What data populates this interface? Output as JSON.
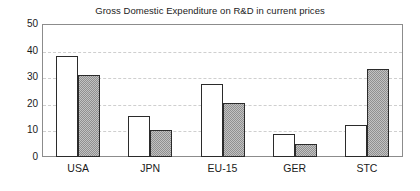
{
  "chart_data": {
    "type": "bar",
    "title": "Gross Domestic Expenditure on R&D in current prices",
    "xlabel": "",
    "ylabel": "",
    "categories": [
      "USA",
      "JPN",
      "EU-15",
      "GER",
      "STC"
    ],
    "series": [
      {
        "name": "series-a",
        "style": "white",
        "values": [
          38,
          15.5,
          27.5,
          8.5,
          12
        ]
      },
      {
        "name": "series-b",
        "style": "gray-hatched",
        "values": [
          31,
          10,
          20.3,
          5,
          33
        ]
      }
    ],
    "ylim": [
      0,
      50
    ],
    "ytick_labels": [
      "0",
      "10",
      "20",
      "30",
      "40",
      "50"
    ],
    "ytick_values": [
      0,
      10,
      20,
      30,
      40,
      50
    ],
    "grid": "horizontal-dashed",
    "legend": "none",
    "colors": {
      "series_a_fill": "#ffffff",
      "series_b_fill": "#909090",
      "bar_outline": "#2b2b2b",
      "gridline": "#cfcfcf",
      "axis": "#8c8c8c",
      "text": "#1a1a1a",
      "background": "#ffffff"
    }
  }
}
